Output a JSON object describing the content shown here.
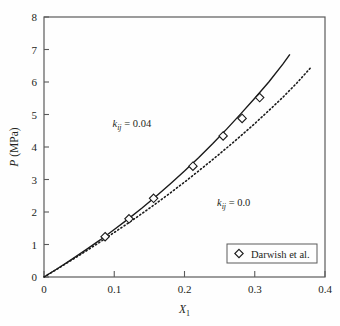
{
  "figure": {
    "background_color": "#fefefe",
    "frame_color": "#5a5a5a",
    "curve_color": "#1a1a1a"
  },
  "axes": {
    "x": {
      "label_main": "X",
      "label_sub": "1",
      "ticks": [
        "0",
        "0.1",
        "0.2",
        "0.3",
        "0.4"
      ],
      "tick_values": [
        0,
        0.1,
        0.2,
        0.3,
        0.4
      ],
      "min": 0,
      "max": 0.4
    },
    "y": {
      "label": "P (MPa)",
      "label_italic": "P",
      "label_rest": " (MPa)",
      "ticks": [
        "0",
        "1",
        "2",
        "3",
        "4",
        "5",
        "6",
        "7",
        "8"
      ],
      "tick_values": [
        0,
        1,
        2,
        3,
        4,
        5,
        6,
        7,
        8
      ],
      "min": 0,
      "max": 8
    }
  },
  "annotations": [
    {
      "name": "kij-upper",
      "symbol": "k",
      "subscript": "ij",
      "equals": " = ",
      "value": "0.04",
      "x": 0.125,
      "y": 4.62
    },
    {
      "name": "kij-lower",
      "symbol": "k",
      "subscript": "ij",
      "equals": " = ",
      "value": "0.0",
      "x": 0.27,
      "y": 2.18
    }
  ],
  "legend": {
    "entries": [
      {
        "label": "Darwish et al.",
        "marker": "diamond-marker"
      }
    ]
  },
  "chart_data": {
    "type": "line",
    "title": "",
    "xlabel": "X_1",
    "ylabel": "P (MPa)",
    "xlim": [
      0,
      0.4
    ],
    "ylim": [
      0,
      8
    ],
    "xticks": [
      0,
      0.1,
      0.2,
      0.3,
      0.4
    ],
    "yticks": [
      0,
      1,
      2,
      3,
      4,
      5,
      6,
      7,
      8
    ],
    "grid": false,
    "legend_position": "lower-right",
    "series": [
      {
        "name": "k_ij = 0.04",
        "style": "solid",
        "color": "#1a1a1a",
        "x": [
          0.0,
          0.02,
          0.04,
          0.06,
          0.08,
          0.1,
          0.12,
          0.14,
          0.16,
          0.18,
          0.2,
          0.22,
          0.24,
          0.26,
          0.28,
          0.3,
          0.32,
          0.34,
          0.35
        ],
        "y": [
          0.0,
          0.27,
          0.55,
          0.84,
          1.14,
          1.46,
          1.79,
          2.13,
          2.49,
          2.87,
          3.26,
          3.67,
          4.1,
          4.55,
          5.02,
          5.5,
          6.0,
          6.55,
          6.85
        ]
      },
      {
        "name": "k_ij = 0.0",
        "style": "dashed",
        "color": "#1a1a1a",
        "x": [
          0.0,
          0.02,
          0.04,
          0.06,
          0.08,
          0.1,
          0.12,
          0.14,
          0.16,
          0.18,
          0.2,
          0.22,
          0.24,
          0.26,
          0.28,
          0.3,
          0.32,
          0.34,
          0.36,
          0.38
        ],
        "y": [
          0.0,
          0.26,
          0.53,
          0.8,
          1.08,
          1.37,
          1.66,
          1.96,
          2.27,
          2.59,
          2.92,
          3.26,
          3.61,
          3.97,
          4.34,
          4.72,
          5.12,
          5.53,
          5.97,
          6.45
        ]
      },
      {
        "name": "Darwish et al.",
        "style": "markers",
        "marker": "diamond",
        "color": "#1a1a1a",
        "x": [
          0.087,
          0.121,
          0.156,
          0.212,
          0.255,
          0.282,
          0.307
        ],
        "y": [
          1.24,
          1.79,
          2.42,
          3.41,
          4.34,
          4.88,
          5.52
        ]
      }
    ]
  }
}
